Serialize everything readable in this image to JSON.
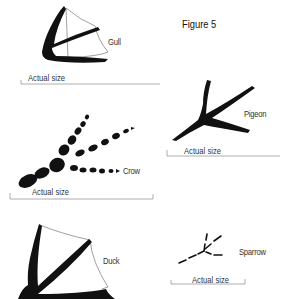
{
  "figure": {
    "title": "Figure 5",
    "scale_label": "Actual size",
    "ink_color": "#111111",
    "web_color": "#888888",
    "line_color": "#999999"
  },
  "tracks": [
    {
      "name": "Gull",
      "scale_label": "Actual size"
    },
    {
      "name": "Pigeon",
      "scale_label": "Actual size"
    },
    {
      "name": "Crow",
      "scale_label": "Actual size"
    },
    {
      "name": "Duck",
      "scale_label": ""
    },
    {
      "name": "Sparrow",
      "scale_label": "Actual size"
    }
  ]
}
